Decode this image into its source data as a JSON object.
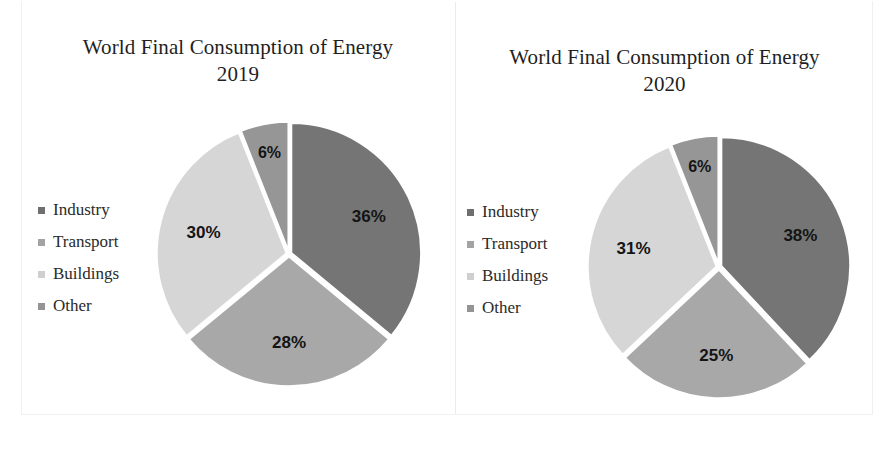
{
  "figure": {
    "background": "#ffffff",
    "panel_count": 2
  },
  "chart_data": [
    {
      "type": "pie",
      "title": "World Final Consumption of Energy\n2019",
      "title_line1": "World Final Consumption of Energy",
      "title_line2": "2019",
      "year": "2019",
      "categories": [
        "Industry",
        "Transport",
        "Buildings",
        "Other"
      ],
      "values": [
        36,
        28,
        30,
        6
      ],
      "labels": [
        "36%",
        "28%",
        "30%",
        "6%"
      ],
      "colors": [
        "#757575",
        "#a8a8a8",
        "#d6d6d6",
        "#969696"
      ],
      "legend_position": "left",
      "legend_marker": "square",
      "start_angle_deg": 0,
      "direction": "clockwise",
      "units": "percent"
    },
    {
      "type": "pie",
      "title": "World Final Consumption of Energy\n2020",
      "title_line1": "World Final Consumption of Energy",
      "title_line2": "2020",
      "year": "2020",
      "categories": [
        "Industry",
        "Transport",
        "Buildings",
        "Other"
      ],
      "values": [
        38,
        25,
        31,
        6
      ],
      "labels": [
        "38%",
        "25%",
        "31%",
        "6%"
      ],
      "colors": [
        "#757575",
        "#a8a8a8",
        "#d6d6d6",
        "#969696"
      ],
      "legend_position": "left",
      "legend_marker": "square",
      "start_angle_deg": 0,
      "direction": "clockwise",
      "units": "percent"
    }
  ],
  "left": {
    "title_line1": "World Final Consumption of Energy",
    "title_line2": "2019",
    "legend": [
      {
        "label": "Industry",
        "color": "#6f6f6f"
      },
      {
        "label": "Transport",
        "color": "#a3a3a3"
      },
      {
        "label": "Buildings",
        "color": "#cfcfcf"
      },
      {
        "label": "Other",
        "color": "#949494"
      }
    ],
    "slices": [
      {
        "name": "Industry",
        "value": 36,
        "label": "36%",
        "color": "#757575"
      },
      {
        "name": "Transport",
        "value": 28,
        "label": "28%",
        "color": "#a8a8a8"
      },
      {
        "name": "Buildings",
        "value": 30,
        "label": "30%",
        "color": "#d6d6d6"
      },
      {
        "name": "Other",
        "value": 6,
        "label": "6%",
        "color": "#969696"
      }
    ]
  },
  "right": {
    "title_line1": "World Final Consumption of Energy",
    "title_line2": "2020",
    "legend": [
      {
        "label": "Industry",
        "color": "#6f6f6f"
      },
      {
        "label": "Transport",
        "color": "#a3a3a3"
      },
      {
        "label": "Buildings",
        "color": "#cfcfcf"
      },
      {
        "label": "Other",
        "color": "#949494"
      }
    ],
    "slices": [
      {
        "name": "Industry",
        "value": 38,
        "label": "38%",
        "color": "#757575"
      },
      {
        "name": "Transport",
        "value": 25,
        "label": "25%",
        "color": "#a8a8a8"
      },
      {
        "name": "Buildings",
        "value": 31,
        "label": "31%",
        "color": "#d6d6d6"
      },
      {
        "name": "Other",
        "value": 6,
        "label": "6%",
        "color": "#969696"
      }
    ]
  }
}
